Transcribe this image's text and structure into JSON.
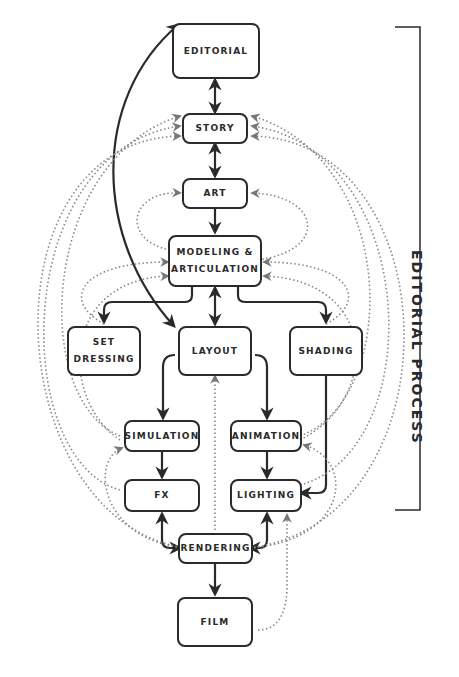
{
  "diagram": {
    "bracket_label": "EDITORIAL PROCESS",
    "nodes": {
      "editorial": "EDITORIAL",
      "story": "STORY",
      "art": "ART",
      "modeling": "MODELING &\nARTICULATION",
      "set_dressing": "SET\nDRESSING",
      "layout": "LAYOUT",
      "shading": "SHADING",
      "simulation": "SIMULATION",
      "animation": "ANIMATION",
      "fx": "FX",
      "lighting": "LIGHTING",
      "rendering": "RENDERING",
      "film": "FILM"
    },
    "solid_edges": [
      {
        "from": "editorial",
        "to": "story",
        "bidirectional": true
      },
      {
        "from": "story",
        "to": "art",
        "bidirectional": true
      },
      {
        "from": "art",
        "to": "modeling",
        "bidirectional": false
      },
      {
        "from": "modeling",
        "to": "set_dressing",
        "bidirectional": false
      },
      {
        "from": "modeling",
        "to": "layout",
        "bidirectional": true
      },
      {
        "from": "modeling",
        "to": "shading",
        "bidirectional": false
      },
      {
        "from": "editorial",
        "to": "layout",
        "bidirectional": true
      },
      {
        "from": "layout",
        "to": "simulation",
        "bidirectional": false
      },
      {
        "from": "layout",
        "to": "animation",
        "bidirectional": false
      },
      {
        "from": "simulation",
        "to": "fx",
        "bidirectional": false
      },
      {
        "from": "animation",
        "to": "lighting",
        "bidirectional": false
      },
      {
        "from": "shading",
        "to": "lighting",
        "bidirectional": false
      },
      {
        "from": "fx",
        "to": "rendering",
        "bidirectional": true
      },
      {
        "from": "lighting",
        "to": "rendering",
        "bidirectional": true
      },
      {
        "from": "rendering",
        "to": "film",
        "bidirectional": false
      }
    ],
    "dotted_feedback_edges": "multiple dotted feedback loops from downstream stages back to STORY, ART, MODELING & ARTICULATION, LAYOUT, SIMULATION, ANIMATION and LIGHTING"
  },
  "colors": {
    "line": "#2a2a2a",
    "dotted": "#888888",
    "background": "#ffffff"
  }
}
